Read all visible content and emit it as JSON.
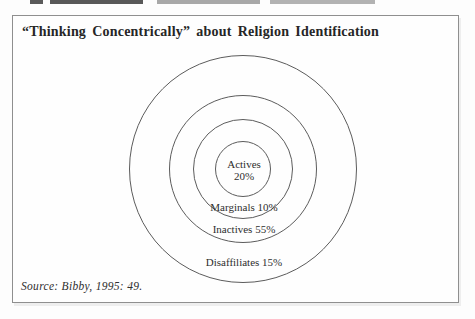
{
  "figure": {
    "title": "“Thinking Concentrically” about Religion Identification",
    "source": "Source: Bibby, 1995: 49."
  },
  "rings": [
    {
      "label": "Actives",
      "value": "20%"
    },
    {
      "label": "Marginals",
      "value": "10%"
    },
    {
      "label": "Inactives",
      "value": "55%"
    },
    {
      "label": "Disaffiliates",
      "value": "15%"
    }
  ],
  "colors": {
    "frame_border": "#8f8f8f",
    "circle_stroke": "#5c5c5c",
    "text": "#2e2e2e"
  }
}
